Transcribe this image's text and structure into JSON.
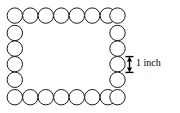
{
  "figure": {
    "type": "geometry-diagram",
    "stroke_color": "#1a1a1a",
    "fill_color": "#ffffff",
    "background_color": "#ffffff"
  },
  "dimension": {
    "label": "1 inch",
    "measures": "circle-diameter",
    "marker": "double-arrow-with-end-caps",
    "color": "#000000"
  },
  "chart_data": {
    "type": "scatter",
    "title": "",
    "xlabel": "",
    "ylabel": "",
    "grid": false,
    "circle_diameter_px": 15.5,
    "circle_diameter_label": "1 inch",
    "counts": {
      "top_row": 8,
      "bottom_row": 8,
      "left_column": 6,
      "right_column": 6,
      "corners_shared": 4,
      "total_circles": 24
    },
    "circles": [
      {
        "cx": 14.8,
        "cy": 15.6,
        "r": 7.7,
        "position": "top-left-corner"
      },
      {
        "cx": 30.3,
        "cy": 15.6,
        "r": 7.7,
        "position": "top"
      },
      {
        "cx": 45.8,
        "cy": 15.6,
        "r": 7.7,
        "position": "top"
      },
      {
        "cx": 61.3,
        "cy": 15.6,
        "r": 7.7,
        "position": "top"
      },
      {
        "cx": 76.8,
        "cy": 15.6,
        "r": 7.7,
        "position": "top"
      },
      {
        "cx": 92.3,
        "cy": 15.6,
        "r": 7.7,
        "position": "top"
      },
      {
        "cx": 107.8,
        "cy": 15.6,
        "r": 7.7,
        "position": "top"
      },
      {
        "cx": 117.5,
        "cy": 15.6,
        "r": 7.7,
        "position": "top-right-corner"
      },
      {
        "cx": 14.8,
        "cy": 33.0,
        "r": 7.7,
        "position": "left"
      },
      {
        "cx": 14.8,
        "cy": 48.6,
        "r": 7.7,
        "position": "left"
      },
      {
        "cx": 14.8,
        "cy": 64.2,
        "r": 7.7,
        "position": "left"
      },
      {
        "cx": 14.8,
        "cy": 79.8,
        "r": 7.7,
        "position": "left"
      },
      {
        "cx": 117.5,
        "cy": 33.0,
        "r": 7.7,
        "position": "right"
      },
      {
        "cx": 117.5,
        "cy": 48.6,
        "r": 7.7,
        "position": "right"
      },
      {
        "cx": 117.5,
        "cy": 64.2,
        "r": 7.7,
        "position": "right"
      },
      {
        "cx": 117.5,
        "cy": 79.8,
        "r": 7.7,
        "position": "right"
      },
      {
        "cx": 14.8,
        "cy": 97.2,
        "r": 7.7,
        "position": "bottom-left-corner"
      },
      {
        "cx": 30.3,
        "cy": 97.2,
        "r": 7.7,
        "position": "bottom"
      },
      {
        "cx": 45.8,
        "cy": 97.2,
        "r": 7.7,
        "position": "bottom"
      },
      {
        "cx": 61.3,
        "cy": 97.2,
        "r": 7.7,
        "position": "bottom"
      },
      {
        "cx": 76.8,
        "cy": 97.2,
        "r": 7.7,
        "position": "bottom"
      },
      {
        "cx": 92.3,
        "cy": 97.2,
        "r": 7.7,
        "position": "bottom"
      },
      {
        "cx": 107.8,
        "cy": 97.2,
        "r": 7.7,
        "position": "bottom"
      },
      {
        "cx": 117.5,
        "cy": 97.2,
        "r": 7.7,
        "position": "bottom-right-corner"
      }
    ],
    "annotations": [
      {
        "text": "1 inch",
        "x": 136,
        "y": 64,
        "kind": "dimension-label"
      }
    ]
  }
}
